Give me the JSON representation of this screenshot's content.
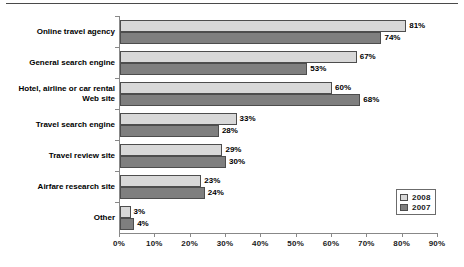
{
  "chart_data": {
    "type": "bar",
    "orientation": "horizontal",
    "title": "",
    "subtitle": "",
    "xlabel": "",
    "ylabel": "",
    "xlim": [
      0,
      90
    ],
    "xtick_labels": [
      "0%",
      "10%",
      "20%",
      "30%",
      "40%",
      "50%",
      "60%",
      "70%",
      "80%",
      "90%"
    ],
    "xticks": [
      0,
      10,
      20,
      30,
      40,
      50,
      60,
      70,
      80,
      90
    ],
    "grid": false,
    "legend_position": "bottom-right",
    "categories": [
      "Online travel agency",
      "General search engine",
      "Hotel, airline or car rental Web site",
      "Travel search engine",
      "Travel review site",
      "Airfare research site",
      "Other"
    ],
    "category_lines": [
      [
        "Online travel agency"
      ],
      [
        "General search engine"
      ],
      [
        "Hotel, airline or car rental",
        "Web site"
      ],
      [
        "Travel search engine"
      ],
      [
        "Travel review site"
      ],
      [
        "Airfare research site"
      ],
      [
        "Other"
      ]
    ],
    "series": [
      {
        "name": "2008",
        "color": "#d8d8d8",
        "values": [
          81,
          67,
          60,
          33,
          29,
          23,
          3
        ],
        "labels": [
          "81%",
          "67%",
          "60%",
          "33%",
          "29%",
          "23%",
          "3%"
        ]
      },
      {
        "name": "2007",
        "color": "#7f7f7f",
        "values": [
          74,
          53,
          68,
          28,
          30,
          24,
          4
        ],
        "labels": [
          "74%",
          "53%",
          "68%",
          "28%",
          "30%",
          "24%",
          "4%"
        ]
      }
    ]
  },
  "legend": {
    "entries": [
      {
        "label": "2008",
        "color": "#d8d8d8"
      },
      {
        "label": "2007",
        "color": "#7f7f7f"
      }
    ]
  },
  "colors": {
    "series_2008": "#d8d8d8",
    "series_2007": "#7f7f7f",
    "axis": "#888888",
    "bar_border": "#4d4d4d",
    "text": "#000000",
    "background": "#ffffff"
  }
}
